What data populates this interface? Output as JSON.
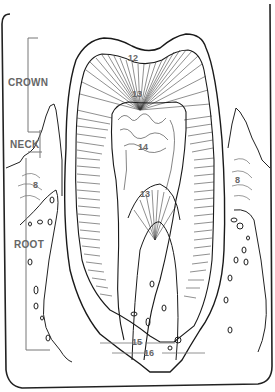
{
  "diagram": {
    "regions": [
      {
        "key": "crown",
        "label": "CROWN"
      },
      {
        "key": "neck",
        "label": "NECK"
      },
      {
        "key": "root",
        "label": "ROOT"
      }
    ],
    "numbers": {
      "enamel": "12",
      "dentin_upper": "13",
      "pulp": "14",
      "dentin_lower": "13",
      "gum_left": "8",
      "gum_right": "8",
      "root_canal": "15",
      "apex": "16"
    },
    "colors": {
      "line": "#1a1a1a",
      "label": "#666666",
      "background": "#ffffff"
    }
  }
}
